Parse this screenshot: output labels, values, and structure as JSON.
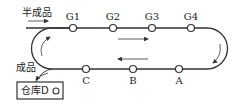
{
  "diagram": {
    "input_label": "半成品",
    "output_label": "成品",
    "warehouse_label": "仓库D",
    "top_stations": [
      "G1",
      "G2",
      "G3",
      "G4"
    ],
    "bottom_stations": [
      "C",
      "B",
      "A"
    ],
    "direction_top": "left-to-right",
    "direction_bottom": "right-to-left"
  }
}
